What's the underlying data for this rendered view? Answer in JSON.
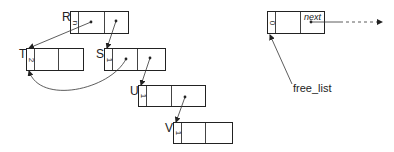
{
  "diagram": {
    "type": "linked-list-memory-blocks",
    "nodes": [
      {
        "id": "R",
        "label": "R",
        "count": "n"
      },
      {
        "id": "T",
        "label": "T",
        "count": "2"
      },
      {
        "id": "S",
        "label": "S",
        "count": "1"
      },
      {
        "id": "U",
        "label": "U",
        "count": "1"
      },
      {
        "id": "V",
        "label": "V",
        "count": "1"
      }
    ],
    "free_block": {
      "count": "0",
      "next_label": "next"
    },
    "free_list_label": "free_list",
    "edges": [
      {
        "from": "R.cell2",
        "to": "T"
      },
      {
        "from": "R.cell3",
        "to": "S"
      },
      {
        "from": "S.cell2",
        "to": "T",
        "style": "curved"
      },
      {
        "from": "S.cell3",
        "to": "U"
      },
      {
        "from": "U.cell3",
        "to": "V"
      },
      {
        "from": "free_list",
        "to": "free_block"
      },
      {
        "from": "free_block.next",
        "to": "right",
        "style": "dashed"
      }
    ]
  }
}
